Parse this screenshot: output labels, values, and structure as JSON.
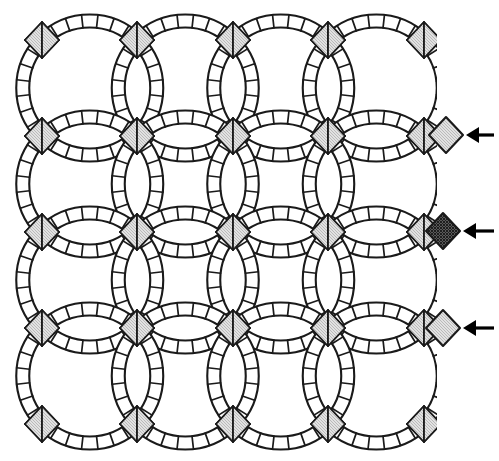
{
  "figure": {
    "kind": "line-drawing",
    "background_color": "#ffffff",
    "stroke_color": "#1a1a1a",
    "canvas": {
      "width": 499,
      "height": 461
    }
  },
  "palette": {
    "outline": "#1a1a1a",
    "patch_fill": "#ffffff",
    "dark_diamond": "#4a4a4a",
    "light_diamond": "#d9d9d9",
    "arrow": "#000000"
  },
  "grid": {
    "label": "ring-intersection-lattice",
    "columns": 5,
    "rows": 5,
    "pitch_x": 95.5,
    "pitch_y": 96.0,
    "origin_x": 42,
    "origin_y": 40,
    "ring_radius": 67,
    "band_width": 13,
    "segments_per_arc": 7
  },
  "intersections": {
    "note": "Each lattice node is a four-quadrant diamond: dark top and bottom wedges, light left and right wedges.",
    "top_wedge": "dark",
    "bottom_wedge": "dark",
    "left_wedge": "light",
    "right_wedge": "light",
    "diamond_half_width": 17,
    "diamond_half_height": 18
  },
  "callouts": {
    "count": 3,
    "items": [
      {
        "name": "callout-top",
        "target": "light-diamond",
        "swatch": "light",
        "diamond_x": 446,
        "diamond_y": 135,
        "arrow_tip_x": 466,
        "arrow_tail_x": 494,
        "arrow_y": 135,
        "label": ""
      },
      {
        "name": "callout-middle",
        "target": "dark-diamond",
        "swatch": "dark",
        "diamond_x": 443,
        "diamond_y": 231,
        "arrow_tip_x": 463,
        "arrow_tail_x": 494,
        "arrow_y": 231,
        "label": ""
      },
      {
        "name": "callout-bottom",
        "target": "light-diamond",
        "swatch": "light",
        "diamond_x": 443,
        "diamond_y": 328,
        "arrow_tip_x": 463,
        "arrow_tail_x": 494,
        "arrow_y": 328,
        "label": ""
      }
    ]
  },
  "chart_data": {
    "type": "table",
    "xlabel": "",
    "ylabel": "",
    "columns": [
      "row",
      "col",
      "node_x",
      "node_y",
      "top_wedge",
      "bottom_wedge",
      "left_wedge",
      "right_wedge"
    ],
    "rows": [
      [
        1,
        1,
        42,
        40,
        "dark",
        "dark",
        "light",
        "light"
      ],
      [
        1,
        2,
        137,
        40,
        "dark",
        "dark",
        "light",
        "light"
      ],
      [
        1,
        3,
        233,
        40,
        "dark",
        "dark",
        "light",
        "light"
      ],
      [
        1,
        4,
        328,
        40,
        "dark",
        "dark",
        "light",
        "light"
      ],
      [
        1,
        5,
        424,
        40,
        "dark",
        "dark",
        "light",
        "light"
      ],
      [
        2,
        1,
        42,
        136,
        "dark",
        "dark",
        "light",
        "light"
      ],
      [
        2,
        2,
        137,
        136,
        "dark",
        "dark",
        "light",
        "light"
      ],
      [
        2,
        3,
        233,
        136,
        "dark",
        "dark",
        "light",
        "light"
      ],
      [
        2,
        4,
        328,
        136,
        "dark",
        "dark",
        "light",
        "light"
      ],
      [
        2,
        5,
        424,
        136,
        "dark",
        "dark",
        "light",
        "light"
      ],
      [
        3,
        1,
        42,
        232,
        "dark",
        "dark",
        "light",
        "light"
      ],
      [
        3,
        2,
        137,
        232,
        "dark",
        "dark",
        "light",
        "light"
      ],
      [
        3,
        3,
        233,
        232,
        "dark",
        "dark",
        "light",
        "light"
      ],
      [
        3,
        4,
        328,
        232,
        "dark",
        "dark",
        "light",
        "light"
      ],
      [
        3,
        5,
        424,
        232,
        "dark",
        "dark",
        "light",
        "light"
      ],
      [
        4,
        1,
        42,
        328,
        "dark",
        "dark",
        "light",
        "light"
      ],
      [
        4,
        2,
        137,
        328,
        "dark",
        "dark",
        "light",
        "light"
      ],
      [
        4,
        3,
        233,
        328,
        "dark",
        "dark",
        "light",
        "light"
      ],
      [
        4,
        4,
        328,
        328,
        "dark",
        "dark",
        "light",
        "light"
      ],
      [
        4,
        5,
        424,
        328,
        "dark",
        "dark",
        "light",
        "light"
      ],
      [
        5,
        1,
        42,
        424,
        "dark",
        "dark",
        "light",
        "light"
      ],
      [
        5,
        2,
        137,
        424,
        "dark",
        "dark",
        "light",
        "light"
      ],
      [
        5,
        3,
        233,
        424,
        "dark",
        "dark",
        "light",
        "light"
      ],
      [
        5,
        4,
        328,
        424,
        "dark",
        "dark",
        "light",
        "light"
      ],
      [
        5,
        5,
        424,
        424,
        "dark",
        "dark",
        "light",
        "light"
      ]
    ]
  }
}
